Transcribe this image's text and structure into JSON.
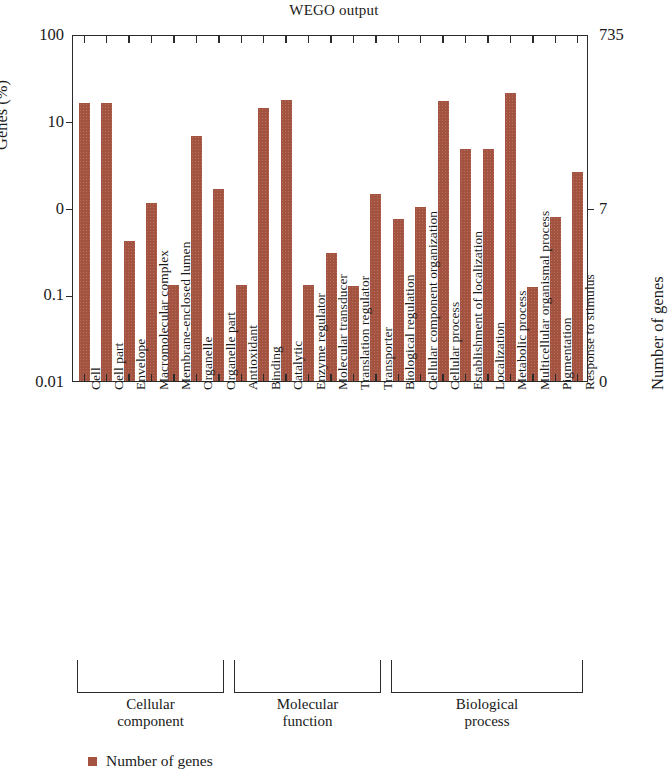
{
  "chart_data": {
    "type": "bar",
    "title": "WEGO output",
    "xlabel": "",
    "ylabel": "Genes (%)",
    "ylabel_right": "Number of genes",
    "yscale": "log",
    "ylim": [
      0.01,
      100
    ],
    "ytick_labels": [
      "100",
      "10",
      "0",
      "0.1",
      "0.01"
    ],
    "ytick_values": [
      100,
      10,
      1,
      0.1,
      0.01
    ],
    "ytick_labels_right": [
      "735",
      "7",
      "0"
    ],
    "ytick_values_right": [
      735,
      7,
      0
    ],
    "grid": false,
    "legend_position": "bottom-left",
    "legend": [
      "Number of genes"
    ],
    "bar_color": "#a3533f",
    "categories": [
      "Cell",
      "Cell part",
      "Envelope",
      "Macromolecular complex",
      "Membrane-enclosed lumen",
      "Organelle",
      "Organelle part",
      "Antioxidant",
      "Binding",
      "Catalytic",
      "Enzyme regulator",
      "Molecular transducer",
      "Translation regulator",
      "Transporter",
      "Biological regulation",
      "Cellular component organization",
      "Cellular process",
      "Establishment of localization",
      "Localization",
      "Metabolic process",
      "Multicellular organismal process",
      "Pigmentation",
      "Response to stimulus"
    ],
    "values": [
      16.0,
      16.0,
      0.41,
      1.12,
      0.128,
      6.6,
      1.65,
      0.128,
      14.2,
      17.5,
      0.128,
      0.3,
      0.125,
      1.45,
      0.74,
      1.02,
      17.0,
      4.7,
      4.7,
      21.0,
      0.122,
      0.78,
      2.6
    ],
    "gene_counts": [
      118,
      118,
      3,
      8,
      1,
      48,
      12,
      1,
      104,
      129,
      1,
      2,
      1,
      11,
      5,
      8,
      125,
      35,
      35,
      154,
      1,
      6,
      19
    ],
    "groups": [
      {
        "name": "Cellular\ncomponent",
        "name_line1": "Cellular",
        "name_line2": "component",
        "start": 0,
        "end": 6
      },
      {
        "name": "Molecular\nfunction",
        "name_line1": "Molecular",
        "name_line2": "function",
        "start": 7,
        "end": 13
      },
      {
        "name": "Biological\nprocess",
        "name_line1": "Biological",
        "name_line2": "process",
        "start": 14,
        "end": 22
      }
    ]
  }
}
